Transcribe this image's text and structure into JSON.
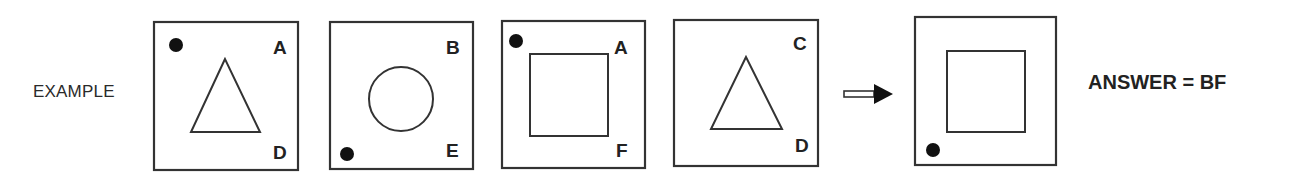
{
  "example_label": "EXAMPLE",
  "answer_text": "ANSWER = BF",
  "panels": [
    {
      "shape": "triangle",
      "dot": "top-left",
      "top_letter": "A",
      "bottom_letter": "D"
    },
    {
      "shape": "circle",
      "dot": "bottom-left",
      "top_letter": "B",
      "bottom_letter": "E"
    },
    {
      "shape": "square",
      "dot": "top-left",
      "top_letter": "A",
      "bottom_letter": "F"
    },
    {
      "shape": "triangle",
      "dot": "none",
      "top_letter": "C",
      "bottom_letter": "D"
    }
  ],
  "arrow": {
    "icon": "right-arrow-icon"
  },
  "result_panel": {
    "shape": "square",
    "dot": "bottom-left"
  }
}
